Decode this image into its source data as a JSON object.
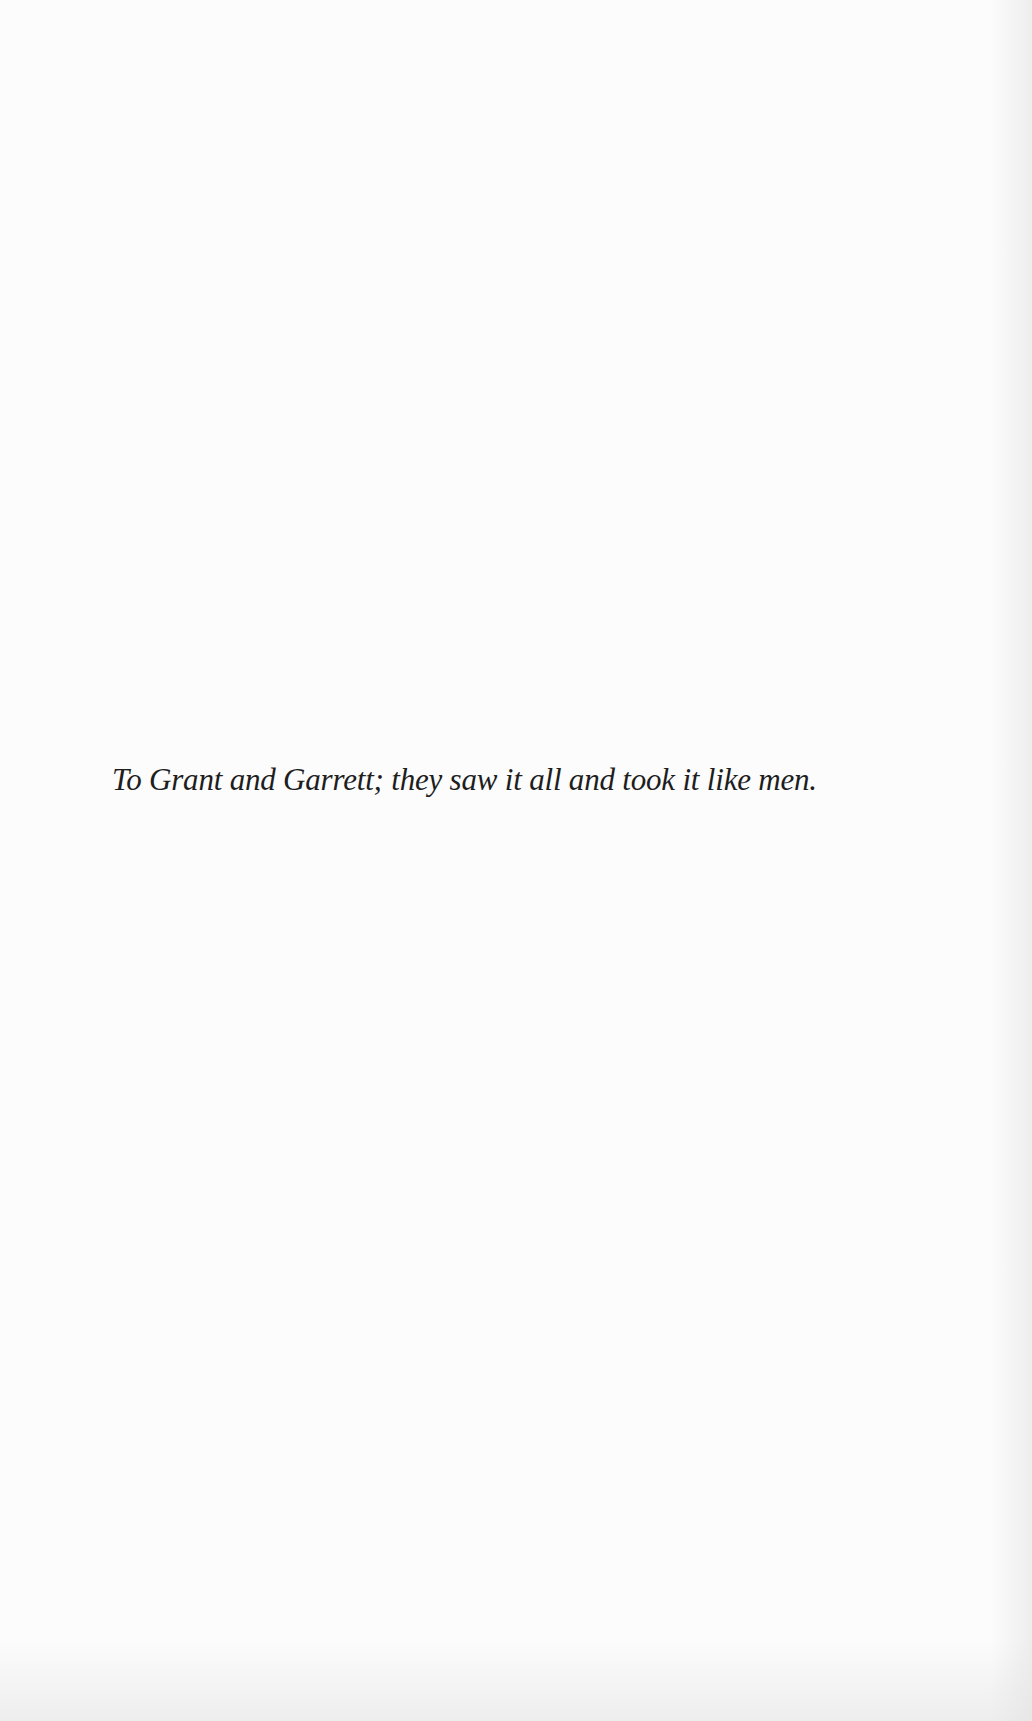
{
  "page": {
    "type": "dedication",
    "dedication_text": "To Grant and Garrett; they saw it all and took it like men."
  },
  "colors": {
    "paper": "#fcfcfc",
    "ink": "#1e1e1e"
  }
}
